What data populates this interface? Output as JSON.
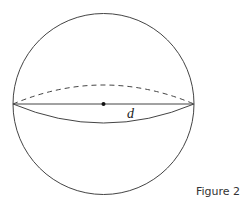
{
  "figure": {
    "caption": "Figure 2",
    "diameter_label": "d",
    "shape": "sphere",
    "stroke_color": "#444444"
  }
}
